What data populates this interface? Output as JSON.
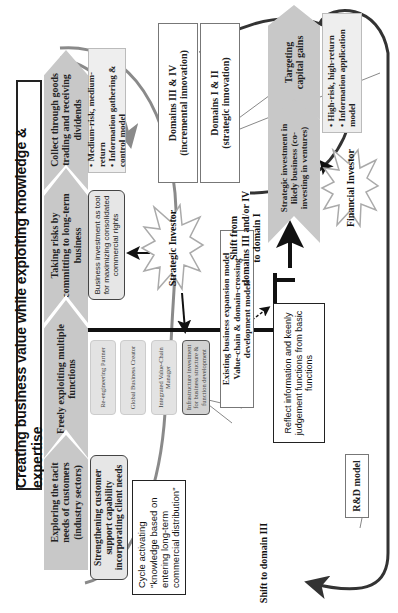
{
  "title": "Creating business value while exploiting knowledge & expertise",
  "upper_chevrons": [
    {
      "label": "Exploring the tacit needs of customers (industry sectors)"
    },
    {
      "label": "Freely exploiting multiple functions"
    },
    {
      "label": "Taking risks by committing to long-term business"
    },
    {
      "label": "Collect through goods trading and receiving dividends"
    }
  ],
  "lower_chevrons": [
    {
      "label": "Strategic investment in likely business (co-investing in ventures)"
    },
    {
      "label": "Targeting capital gains"
    }
  ],
  "boxes": {
    "strengthening": "Strengthening customer support capability incorporating client needs",
    "cycle": {
      "line1": "Cycle activating",
      "line2": "\"knowledge based on",
      "line3": "entering long-term",
      "line4": "commercial distribution\""
    },
    "functions": [
      "Re-engineering Partner",
      "Global Business Creator",
      "Integrated Value-Chain Manager",
      "Infrastructure investment for business structure & function development"
    ],
    "business_investment": "Business investment as tool for maximizing consolidated commercial rights",
    "medium_risk": {
      "bullet1": "• Medium-risk, medium-return",
      "bullet2": "• Information gathering & control model"
    },
    "high_risk": {
      "bullet1": "• High-risk, high-return",
      "bullet2": "• Information application model"
    },
    "reflect": "Reflect information and keenly judgement functions from basic functions"
  },
  "callouts": {
    "domains_34": {
      "line1": "Domains III & IV",
      "line2": "(incremental innovation)"
    },
    "domains_12": {
      "line1": "Domains I & II",
      "line2": "(strategic  innovation)"
    },
    "existing": {
      "line1": "Existing business expansion model",
      "line2": "Value-chain & domain-crossing development models"
    },
    "rd": "R&D model"
  },
  "investors": {
    "strategic": "Strategic Investor",
    "financial": "Financial Investor"
  },
  "labels": {
    "shift_to_domain1": {
      "line1": "Shift from",
      "line2": "domains III and/or IV",
      "line3": "to domain I"
    },
    "shift_to_domain3": "Shift to domain III"
  },
  "colors": {
    "chevron": "#c8c8c8",
    "gray_arrow": "#8a8a8a",
    "dark_arrow": "#333333",
    "box_fill": "#e6e6e6"
  }
}
